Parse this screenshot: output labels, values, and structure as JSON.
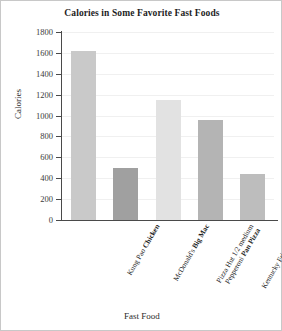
{
  "chart_data": {
    "type": "bar",
    "title": "Calories in Some Favorite Fast Foods",
    "xlabel": "Fast Food",
    "ylabel": "Calories",
    "ylim": [
      0,
      1800
    ],
    "ytick_step": 200,
    "yticks": [
      "1800",
      "1600",
      "1400",
      "1200",
      "1000",
      "800",
      "600",
      "400",
      "200",
      "0"
    ],
    "grid": true,
    "legend": "none",
    "categories": [
      "Kung Pao Chicken",
      "McDonald's Big Mac",
      "Pizza Hut 1/2 medium Pepperoni Pan Pizza",
      "Kentucky Fried Chicken 2-piece dinner",
      "Taco Bell Beef Burrito"
    ],
    "values": [
      1620,
      500,
      1150,
      960,
      440
    ]
  },
  "bars": [
    {
      "name": "kung-pao-chicken",
      "value": 1620,
      "color": "#c9c9c9",
      "label_lines": [
        {
          "plain": "Kung Pao ",
          "bold": "Chicken"
        }
      ]
    },
    {
      "name": "mcdonalds-big-mac",
      "value": 500,
      "color": "#a0a0a0",
      "label_lines": [
        {
          "plain": "McDonald's ",
          "bold": "Big Mac"
        }
      ]
    },
    {
      "name": "pizza-hut-pan-pizza",
      "value": 1150,
      "color": "#e2e2e2",
      "label_lines": [
        {
          "plain": "Pizza Hut 1/2 medium",
          "bold": ""
        },
        {
          "plain": "Pepperoni ",
          "bold": "Pan Pizza"
        }
      ]
    },
    {
      "name": "kfc-2-piece-dinner",
      "value": 960,
      "color": "#b4b4b4",
      "label_lines": [
        {
          "plain": "Kentucky Fried Chicken",
          "bold": ""
        },
        {
          "plain": "",
          "bold": "2-piece dinner"
        }
      ]
    },
    {
      "name": "taco-bell-beef-burrito",
      "value": 440,
      "color": "#bdbdbd",
      "label_lines": [
        {
          "plain": "Taco Bell ",
          "bold": "Beef Burrito"
        }
      ]
    }
  ]
}
